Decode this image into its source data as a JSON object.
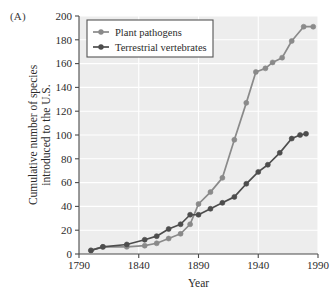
{
  "figure": {
    "panel_label": "(A)",
    "background_color": "#ffffff",
    "plot_background_color": "#ededed",
    "grid_color": "#ffffff",
    "axis_color": "#4a4a4a"
  },
  "legend": {
    "position": "top-left-inside",
    "border_color": "#555555",
    "background_color": "#ffffff",
    "entries": [
      {
        "label": "Plant pathogens",
        "color": "#8a8a8a",
        "marker": "circle"
      },
      {
        "label": "Terrestrial vertebrates",
        "color": "#4d4d4d",
        "marker": "circle"
      }
    ]
  },
  "chart_data": {
    "type": "line",
    "title": "",
    "subtitle": "",
    "xlabel": "Year",
    "ylabel": "Cumulative number of species introduced to the U.S.",
    "ylabel_line1": "Cumulative number of species",
    "ylabel_line2": "introduced to the U.S.",
    "xlim": [
      1790,
      1990
    ],
    "ylim": [
      0,
      200
    ],
    "xticks": [
      1790,
      1840,
      1890,
      1940,
      1990
    ],
    "yticks": [
      0,
      20,
      40,
      60,
      80,
      100,
      120,
      140,
      160,
      180,
      200
    ],
    "grid": true,
    "grid_axis": "both",
    "legend_position": "upper left",
    "series": [
      {
        "name": "Plant pathogens",
        "color": "#8a8a8a",
        "marker": "circle",
        "x": [
          1800,
          1810,
          1830,
          1845,
          1855,
          1865,
          1875,
          1883,
          1890,
          1900,
          1910,
          1920,
          1930,
          1938,
          1946,
          1952,
          1960,
          1968,
          1978,
          1986
        ],
        "y": [
          3,
          6,
          6,
          7,
          9,
          13,
          17,
          25,
          42,
          52,
          64,
          96,
          127,
          153,
          156,
          161,
          165,
          179,
          191,
          191
        ]
      },
      {
        "name": "Terrestrial vertebrates",
        "color": "#4d4d4d",
        "marker": "circle",
        "x": [
          1800,
          1810,
          1830,
          1845,
          1855,
          1865,
          1875,
          1883,
          1890,
          1900,
          1910,
          1920,
          1930,
          1940,
          1948,
          1958,
          1968,
          1975,
          1980
        ],
        "y": [
          3,
          6,
          8,
          12,
          15,
          21,
          25,
          33,
          33,
          38,
          43,
          48,
          59,
          69,
          75,
          85,
          97,
          100,
          101
        ]
      }
    ]
  }
}
